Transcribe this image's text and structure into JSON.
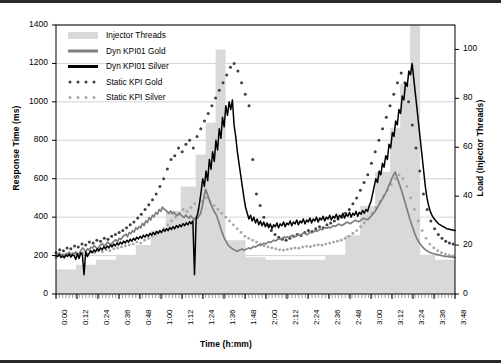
{
  "chart_data": {
    "type": "area",
    "title": "",
    "xlabel": "Time (h:mm)",
    "ylabel": "Response Time (ms)",
    "y2label": "Load (Injector Threads)",
    "ylim": [
      0,
      1400
    ],
    "y2lim": [
      0,
      110
    ],
    "yticks": [
      0,
      200,
      400,
      600,
      800,
      1000,
      1200,
      1400
    ],
    "y2ticks": [
      0,
      20,
      40,
      60,
      80,
      100
    ],
    "grid": true,
    "legend_position": "top-left",
    "xticks": [
      "0:00",
      "0:12",
      "0:24",
      "0:36",
      "0:48",
      "1:00",
      "1:12",
      "1:24",
      "1:36",
      "1:48",
      "2:00",
      "2:12",
      "2:24",
      "2:36",
      "2:48",
      "3:00",
      "3:12",
      "3:24",
      "3:36",
      "3:48"
    ],
    "x_range_minutes": [
      0,
      240
    ],
    "colors": {
      "injector_threads_fill": "#d9d9d9",
      "dyn_kpi01_gold": "#7f7f7f",
      "dyn_kpi01_silver": "#000000",
      "static_kpi_gold": "#404040",
      "static_kpi_silver": "#a6a6a6",
      "gridline": "#c8c8c8",
      "axis": "#000000"
    },
    "series": [
      {
        "name": "Injector Threads",
        "type": "area-step",
        "axis": "y2",
        "unit": "threads",
        "steps": [
          {
            "t": 0,
            "value": 10
          },
          {
            "t": 12,
            "value": 12
          },
          {
            "t": 24,
            "value": 14
          },
          {
            "t": 36,
            "value": 16
          },
          {
            "t": 48,
            "value": 20
          },
          {
            "t": 57,
            "value": 26
          },
          {
            "t": 66,
            "value": 34
          },
          {
            "t": 75,
            "value": 44
          },
          {
            "t": 84,
            "value": 57
          },
          {
            "t": 90,
            "value": 70
          },
          {
            "t": 96,
            "value": 100
          },
          {
            "t": 102,
            "value": 22
          },
          {
            "t": 114,
            "value": 15
          },
          {
            "t": 126,
            "value": 14
          },
          {
            "t": 138,
            "value": 14
          },
          {
            "t": 150,
            "value": 14
          },
          {
            "t": 162,
            "value": 16
          },
          {
            "t": 174,
            "value": 24
          },
          {
            "t": 183,
            "value": 36
          },
          {
            "t": 192,
            "value": 50
          },
          {
            "t": 201,
            "value": 68
          },
          {
            "t": 207,
            "value": 86
          },
          {
            "t": 213,
            "value": 110
          },
          {
            "t": 219,
            "value": 16
          },
          {
            "t": 228,
            "value": 14
          },
          {
            "t": 240,
            "value": 14
          }
        ]
      },
      {
        "name": "Dyn KPI01 Gold",
        "type": "line",
        "axis": "y",
        "unit": "ms",
        "values": [
          210,
          205,
          215,
          200,
          208,
          198,
          212,
          206,
          218,
          202,
          214,
          209,
          220,
          205,
          213,
          226,
          240,
          232,
          221,
          236,
          228,
          244,
          239,
          252,
          243,
          235,
          248,
          256,
          262,
          249,
          258,
          270,
          263,
          255,
          268,
          276,
          282,
          271,
          290,
          284,
          296,
          305,
          312,
          298,
          320,
          314,
          330,
          322,
          345,
          336,
          352,
          344,
          368,
          356,
          380,
          372,
          398,
          385,
          410,
          402,
          424,
          415,
          440,
          430,
          452,
          442,
          436,
          428,
          420,
          432,
          418,
          426,
          414,
          408,
          420,
          412,
          405,
          398,
          410,
          402,
          395,
          406,
          398,
          388,
          400,
          392,
          406,
          420,
          455,
          505,
          545,
          520,
          495,
          470,
          450,
          432,
          418,
          400,
          372,
          344,
          318,
          296,
          278,
          262,
          250,
          242,
          236,
          230,
          226,
          222,
          226,
          230,
          234,
          228,
          232,
          236,
          240,
          235,
          242,
          248,
          244,
          250,
          256,
          252,
          258,
          264,
          260,
          266,
          272,
          268,
          274,
          280,
          276,
          282,
          288,
          284,
          290,
          296,
          292,
          298,
          294,
          300,
          306,
          302,
          298,
          304,
          310,
          306,
          312,
          318,
          314,
          308,
          316,
          322,
          318,
          324,
          330,
          326,
          332,
          338,
          334,
          340,
          346,
          342,
          348,
          344,
          350,
          356,
          352,
          358,
          364,
          360,
          356,
          362,
          368,
          374,
          370,
          366,
          372,
          378,
          384,
          380,
          376,
          382,
          388,
          394,
          390,
          386,
          392,
          400,
          410,
          420,
          430,
          445,
          460,
          475,
          490,
          505,
          520,
          540,
          560,
          580,
          600,
          620,
          635,
          610,
          585,
          560,
          535,
          505,
          475,
          445,
          415,
          385,
          360,
          335,
          310,
          290,
          275,
          262,
          250,
          240,
          232,
          226,
          220,
          216,
          212,
          210,
          208,
          206,
          204,
          202,
          200,
          198,
          196,
          195,
          194,
          193,
          192,
          191,
          190
        ]
      },
      {
        "name": "Dyn KPI01 Silver",
        "type": "line",
        "axis": "y",
        "unit": "ms",
        "values": [
          200,
          195,
          205,
          190,
          198,
          188,
          202,
          196,
          208,
          192,
          204,
          199,
          180,
          210,
          185,
          215,
          205,
          100,
          220,
          195,
          210,
          225,
          215,
          230,
          220,
          235,
          225,
          240,
          230,
          246,
          236,
          250,
          240,
          255,
          245,
          260,
          250,
          265,
          255,
          270,
          260,
          275,
          265,
          280,
          270,
          285,
          275,
          290,
          280,
          296,
          286,
          300,
          290,
          306,
          296,
          310,
          300,
          316,
          306,
          320,
          310,
          326,
          316,
          330,
          320,
          336,
          326,
          340,
          330,
          346,
          336,
          350,
          340,
          356,
          346,
          360,
          350,
          366,
          356,
          370,
          360,
          376,
          366,
          380,
          100,
          390,
          420,
          470,
          530,
          600,
          560,
          640,
          590,
          700,
          650,
          740,
          690,
          800,
          750,
          860,
          810,
          920,
          870,
          980,
          930,
          1000,
          960,
          1010,
          880,
          820,
          740,
          680,
          620,
          560,
          500,
          450,
          420,
          390,
          410,
          380,
          400,
          370,
          390,
          360,
          380,
          355,
          375,
          350,
          370,
          345,
          365,
          340,
          360,
          350,
          370,
          345,
          365,
          355,
          375,
          350,
          370,
          360,
          380,
          355,
          375,
          365,
          385,
          360,
          380,
          370,
          390,
          365,
          385,
          375,
          395,
          370,
          390,
          380,
          400,
          375,
          395,
          385,
          405,
          380,
          400,
          390,
          410,
          385,
          405,
          395,
          415,
          390,
          410,
          400,
          420,
          395,
          415,
          405,
          425,
          400,
          420,
          410,
          430,
          405,
          425,
          415,
          435,
          420,
          440,
          430,
          460,
          480,
          520,
          560,
          600,
          580,
          640,
          620,
          680,
          660,
          720,
          700,
          780,
          760,
          840,
          820,
          900,
          880,
          960,
          940,
          1030,
          1010,
          1100,
          1080,
          1160,
          1140,
          1200,
          1120,
          1040,
          960,
          880,
          800,
          720,
          640,
          560,
          500,
          460,
          430,
          410,
          395,
          385,
          375,
          365,
          360,
          355,
          350,
          345,
          340,
          338,
          336,
          334,
          332,
          330
        ]
      },
      {
        "name": "Static KPI Gold",
        "type": "scatter-dotted",
        "axis": "y",
        "unit": "ms",
        "values": [
          215,
          null,
          230,
          null,
          225,
          null,
          240,
          null,
          235,
          null,
          250,
          null,
          245,
          null,
          260,
          null,
          255,
          null,
          270,
          null,
          265,
          null,
          280,
          null,
          275,
          null,
          290,
          null,
          285,
          null,
          300,
          null,
          310,
          null,
          320,
          null,
          330,
          null,
          345,
          null,
          360,
          null,
          375,
          null,
          395,
          null,
          415,
          null,
          440,
          null,
          465,
          null,
          490,
          null,
          520,
          null,
          560,
          null,
          600,
          null,
          650,
          null,
          700,
          null,
          720,
          null,
          760,
          null,
          740,
          null,
          780,
          null,
          800,
          null,
          760,
          null,
          820,
          null,
          860,
          null,
          900,
          null,
          940,
          null,
          980,
          null,
          1020,
          null,
          1060,
          null,
          1100,
          null,
          1140,
          null,
          1180,
          null,
          1200,
          null,
          1160,
          null,
          1100,
          null,
          1040,
          null,
          980,
          null,
          700,
          null,
          520,
          null,
          460,
          null,
          400,
          null,
          360,
          null,
          330,
          null,
          310,
          null,
          295,
          null,
          285,
          null,
          280,
          null,
          290,
          null,
          300,
          null,
          310,
          null,
          305,
          null,
          320,
          null,
          330,
          null,
          325,
          null,
          340,
          null,
          350,
          null,
          345,
          null,
          360,
          null,
          370,
          null,
          380,
          null,
          390,
          null,
          400,
          null,
          420,
          null,
          440,
          null,
          470,
          null,
          500,
          null,
          540,
          null,
          580,
          null,
          620,
          null,
          680,
          null,
          740,
          null,
          800,
          null,
          860,
          null,
          920,
          null,
          980,
          null,
          1040,
          null,
          1100,
          null,
          1150,
          null,
          1100,
          null,
          1000,
          null,
          880,
          null,
          760,
          null,
          640,
          null,
          520,
          null,
          440,
          null,
          380,
          null,
          340,
          null,
          310,
          null,
          290,
          null,
          275,
          null,
          265,
          null,
          260,
          null
        ]
      },
      {
        "name": "Static KPI Silver",
        "type": "scatter-dotted",
        "axis": "y",
        "unit": "ms",
        "values": [
          190,
          null,
          200,
          null,
          195,
          null,
          205,
          null,
          200,
          null,
          210,
          null,
          205,
          null,
          215,
          null,
          210,
          null,
          220,
          null,
          215,
          null,
          225,
          null,
          220,
          null,
          230,
          null,
          225,
          null,
          235,
          null,
          240,
          null,
          245,
          null,
          250,
          null,
          255,
          null,
          260,
          null,
          270,
          null,
          265,
          null,
          280,
          null,
          290,
          null,
          300,
          null,
          310,
          null,
          320,
          null,
          340,
          null,
          360,
          null,
          380,
          null,
          400,
          null,
          420,
          null,
          440,
          null,
          430,
          null,
          450,
          null,
          470,
          null,
          440,
          null,
          480,
          null,
          500,
          null,
          480,
          null,
          460,
          null,
          440,
          null,
          420,
          null,
          400,
          null,
          380,
          null,
          360,
          null,
          340,
          null,
          320,
          null,
          300,
          null,
          290,
          null,
          280,
          null,
          270,
          null,
          260,
          null,
          250,
          null,
          245,
          null,
          240,
          null,
          235,
          null,
          230,
          null,
          228,
          null,
          232,
          null,
          236,
          null,
          240,
          null,
          238,
          null,
          244,
          null,
          248,
          null,
          246,
          null,
          252,
          null,
          256,
          null,
          254,
          null,
          260,
          null,
          265,
          null,
          270,
          null,
          275,
          null,
          280,
          null,
          290,
          null,
          300,
          null,
          315,
          null,
          330,
          null,
          350,
          null,
          370,
          null,
          390,
          null,
          420,
          null,
          450,
          null,
          480,
          null,
          510,
          null,
          540,
          null,
          570,
          null,
          600,
          null,
          620,
          null,
          600,
          null,
          560,
          null,
          500,
          null,
          440,
          null,
          380,
          null,
          330,
          null,
          290,
          null,
          260,
          null,
          240,
          null,
          225,
          null,
          215,
          null,
          208,
          null,
          202,
          null,
          198,
          null
        ]
      }
    ]
  },
  "legend": {
    "items": [
      {
        "label": "Injector Threads",
        "marker": "area-swatch",
        "color": "#d9d9d9"
      },
      {
        "label": "Dyn KPI01 Gold",
        "marker": "thick-line",
        "color": "#7f7f7f"
      },
      {
        "label": "Dyn KPI01 Silver",
        "marker": "thick-line",
        "color": "#000000"
      },
      {
        "label": "Static KPI Gold",
        "marker": "dotted",
        "color": "#404040"
      },
      {
        "label": "Static KPI Silver",
        "marker": "dotted",
        "color": "#a6a6a6"
      }
    ]
  }
}
